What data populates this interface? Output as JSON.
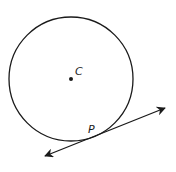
{
  "diagram": {
    "type": "circle-with-tangent-line",
    "circle": {
      "center_label": "C",
      "cx": 71,
      "cy": 79,
      "r": 62
    },
    "tangent_point_label": "P",
    "tangent_line": {
      "x1": 45,
      "y1": 156,
      "x2": 165,
      "y2": 108,
      "arrows": "both"
    },
    "colors": {
      "stroke": "#1a1a1a",
      "background": "#ffffff"
    }
  }
}
